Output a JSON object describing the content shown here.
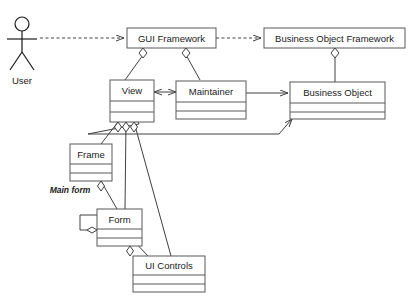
{
  "diagram": {
    "type": "uml-class-diagram",
    "actor": {
      "name": "User",
      "label": "User"
    },
    "classes": [
      {
        "id": "gui-framework",
        "label": "GUI Framework",
        "compartments": 1
      },
      {
        "id": "business-object-framework",
        "label": "Business Object Framework",
        "compartments": 1
      },
      {
        "id": "view",
        "label": "View",
        "compartments": 3
      },
      {
        "id": "maintainer",
        "label": "Maintainer",
        "compartments": 3
      },
      {
        "id": "business-object",
        "label": "Business Object",
        "compartments": 3
      },
      {
        "id": "frame",
        "label": "Frame",
        "compartments": 3
      },
      {
        "id": "form",
        "label": "Form",
        "compartments": 3
      },
      {
        "id": "ui-controls",
        "label": "UI Controls",
        "compartments": 3
      }
    ],
    "edge_labels": [
      {
        "id": "main-form",
        "label": "Main form"
      }
    ],
    "connections": [
      {
        "from": "User",
        "to": "GUI Framework",
        "style": "dashed",
        "arrow": "open"
      },
      {
        "from": "GUI Framework",
        "to": "Business Object Framework",
        "style": "dashed",
        "arrow": "open"
      },
      {
        "from": "GUI Framework",
        "to": "View",
        "style": "aggregation"
      },
      {
        "from": "GUI Framework",
        "to": "Maintainer",
        "style": "aggregation"
      },
      {
        "from": "Business Object Framework",
        "to": "Business Object",
        "style": "aggregation"
      },
      {
        "from": "View",
        "to": "Maintainer",
        "style": "association",
        "arrow": "both"
      },
      {
        "from": "Maintainer",
        "to": "Business Object",
        "style": "association",
        "arrow": "open"
      },
      {
        "from": "View",
        "to": "Business Object",
        "style": "association",
        "arrow": "open"
      },
      {
        "from": "View",
        "to": "Frame",
        "style": "aggregation"
      },
      {
        "from": "View",
        "to": "Form",
        "style": "aggregation"
      },
      {
        "from": "View",
        "to": "UI Controls",
        "style": "aggregation"
      },
      {
        "from": "Frame",
        "to": "Form",
        "style": "aggregation",
        "label": "Main form"
      },
      {
        "from": "Form",
        "to": "Form",
        "style": "aggregation-self"
      },
      {
        "from": "Form",
        "to": "UI Controls",
        "style": "aggregation"
      }
    ],
    "colors": {
      "background": "#ffffff",
      "box_stroke": "#595959",
      "connector": "#404040",
      "text": "#1a1a1a"
    }
  }
}
